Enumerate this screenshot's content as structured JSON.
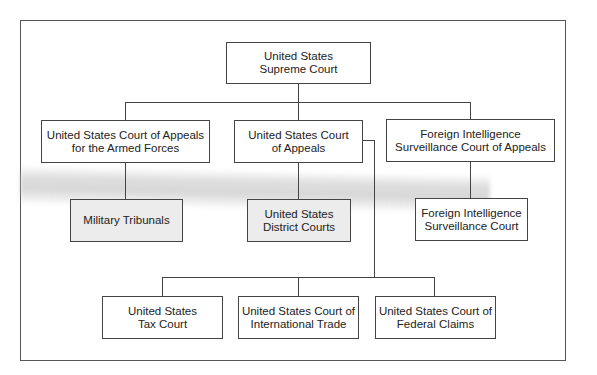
{
  "diagram": {
    "type": "org-chart",
    "title": "",
    "nodes": [
      {
        "id": "supreme",
        "label": "United States\nSupreme Court",
        "line1": "United States",
        "line2": "Supreme Court",
        "level": 0
      },
      {
        "id": "caaf",
        "label": "United States Court of Appeals for the Armed Forces",
        "line1": "United States Court of Appeals",
        "line2": "for the Armed Forces",
        "level": 1
      },
      {
        "id": "appeals",
        "label": "United States Court of Appeals",
        "line1": "United States Court",
        "line2": "of Appeals",
        "level": 1
      },
      {
        "id": "fiscr",
        "label": "Foreign Intelligence Surveillance Court of Appeals",
        "line1": "Foreign Intelligence",
        "line2": "Surveillance Court of Appeals",
        "level": 1
      },
      {
        "id": "military",
        "label": "Military Tribunals",
        "line1": "Military Tribunals",
        "line2": "",
        "level": 2
      },
      {
        "id": "district",
        "label": "United States District Courts",
        "line1": "United States",
        "line2": "District Courts",
        "level": 2
      },
      {
        "id": "fisc",
        "label": "Foreign Intelligence Surveillance Court",
        "line1": "Foreign Intelligence",
        "line2": "Surveillance Court",
        "level": 2
      },
      {
        "id": "tax",
        "label": "United States Tax Court",
        "line1": "United States",
        "line2": "Tax Court",
        "level": 3
      },
      {
        "id": "trade",
        "label": "United States Court of International Trade",
        "line1": "United States Court of",
        "line2": "International Trade",
        "level": 3
      },
      {
        "id": "claims",
        "label": "United States Court of Federal Claims",
        "line1": "United States Court of",
        "line2": "Federal Claims",
        "level": 3
      }
    ],
    "edges": [
      [
        "supreme",
        "caaf"
      ],
      [
        "supreme",
        "appeals"
      ],
      [
        "supreme",
        "fiscr"
      ],
      [
        "caaf",
        "military"
      ],
      [
        "appeals",
        "district"
      ],
      [
        "fiscr",
        "fisc"
      ],
      [
        "appeals",
        "tax"
      ],
      [
        "appeals",
        "trade"
      ],
      [
        "appeals",
        "claims"
      ]
    ]
  }
}
